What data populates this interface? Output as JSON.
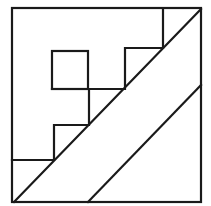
{
  "diagram": {
    "type": "geometric-line-drawing",
    "colors": {
      "background": "#ffffff",
      "stroke": "#1a1a1a"
    },
    "outer_square": {
      "x1": 12,
      "y1": 8,
      "x2": 201,
      "y2": 202
    },
    "inner_square": {
      "x1": 52,
      "y1": 51,
      "x2": 88,
      "y2": 89
    },
    "staircase": [
      [
        163,
        8
      ],
      [
        163,
        48
      ],
      [
        125,
        48
      ],
      [
        125,
        89
      ],
      [
        89,
        89
      ],
      [
        89,
        125
      ],
      [
        54,
        125
      ],
      [
        54,
        160
      ],
      [
        12,
        160
      ]
    ],
    "inner_square_to_stair_link": [
      [
        52,
        89
      ],
      [
        89,
        89
      ]
    ],
    "diagonals": [
      {
        "x1": 14,
        "y1": 202,
        "x2": 201,
        "y2": 9
      },
      {
        "x1": 88,
        "y1": 202,
        "x2": 201,
        "y2": 85
      }
    ]
  }
}
